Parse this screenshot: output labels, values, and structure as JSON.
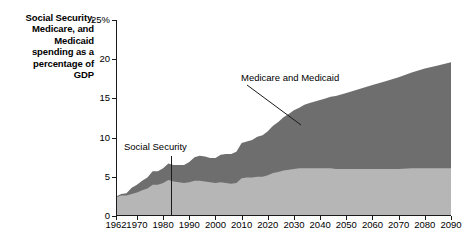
{
  "title": {
    "lines": [
      "Social Security,",
      "Medicare, and",
      "Medicaid",
      "spending as a",
      "percentage of",
      "GDP"
    ]
  },
  "annotations": {
    "social_security": "Social Security",
    "medicare_medicaid": "Medicare and Medicaid"
  },
  "colors": {
    "social_security_band": "#b6b6b6",
    "medicare_medicaid_band": "#6e6e6e",
    "axis": "#1a1a1a",
    "background": "#ffffff"
  },
  "chart_data": {
    "type": "area",
    "stacked": true,
    "title": "Social Security, Medicare, and Medicaid spending as a percentage of GDP",
    "xlabel": "",
    "ylabel": "",
    "xlim": [
      1962,
      2090
    ],
    "ylim": [
      0,
      25
    ],
    "grid": false,
    "legend": "annotations-inline",
    "ytick_labels": [
      "0",
      "5",
      "10",
      "15",
      "20",
      "25%"
    ],
    "ytick_values": [
      0,
      5,
      10,
      15,
      20,
      25
    ],
    "xtick_labels": [
      "1962",
      "1970",
      "1980",
      "1990",
      "2000",
      "2010",
      "2020",
      "2030",
      "2040",
      "2050",
      "2060",
      "2070",
      "2080",
      "2090"
    ],
    "xtick_values": [
      1962,
      1970,
      1980,
      1990,
      2000,
      2010,
      2020,
      2030,
      2040,
      2050,
      2060,
      2070,
      2080,
      2090
    ],
    "x": [
      1962,
      1964,
      1966,
      1968,
      1970,
      1972,
      1974,
      1976,
      1978,
      1980,
      1982,
      1984,
      1986,
      1988,
      1990,
      1992,
      1994,
      1996,
      1998,
      2000,
      2002,
      2004,
      2006,
      2008,
      2010,
      2012,
      2014,
      2016,
      2018,
      2020,
      2022,
      2024,
      2026,
      2028,
      2030,
      2032,
      2034,
      2036,
      2038,
      2040,
      2042,
      2044,
      2046,
      2048,
      2050,
      2055,
      2060,
      2065,
      2070,
      2075,
      2080,
      2085,
      2090
    ],
    "series": [
      {
        "name": "Social Security",
        "color": "#b6b6b6",
        "values": [
          2.4,
          2.6,
          2.6,
          2.8,
          3.0,
          3.3,
          3.5,
          4.0,
          4.0,
          4.2,
          4.6,
          4.4,
          4.3,
          4.2,
          4.3,
          4.5,
          4.5,
          4.4,
          4.3,
          4.2,
          4.3,
          4.2,
          4.1,
          4.2,
          4.8,
          4.9,
          4.9,
          5.0,
          5.0,
          5.2,
          5.5,
          5.6,
          5.8,
          5.9,
          6.0,
          6.1,
          6.1,
          6.1,
          6.1,
          6.1,
          6.1,
          6.1,
          6.0,
          6.0,
          6.0,
          6.0,
          6.0,
          6.0,
          6.0,
          6.1,
          6.1,
          6.1,
          6.1
        ]
      },
      {
        "name": "Medicare and Medicaid",
        "color": "#6e6e6e",
        "values": [
          0.1,
          0.2,
          0.3,
          0.8,
          1.0,
          1.2,
          1.4,
          1.7,
          1.7,
          1.9,
          2.1,
          2.1,
          2.2,
          2.3,
          2.6,
          3.0,
          3.2,
          3.2,
          3.1,
          3.2,
          3.5,
          3.7,
          3.8,
          4.0,
          4.5,
          4.6,
          4.8,
          5.1,
          5.3,
          5.6,
          6.0,
          6.4,
          6.8,
          7.1,
          7.5,
          7.7,
          8.1,
          8.3,
          8.5,
          8.7,
          8.9,
          9.1,
          9.3,
          9.5,
          9.7,
          10.2,
          10.7,
          11.2,
          11.7,
          12.2,
          12.7,
          13.1,
          13.5
        ]
      }
    ],
    "total_values": [
      2.5,
      2.8,
      2.9,
      3.6,
      4.0,
      4.5,
      4.9,
      5.7,
      5.7,
      6.1,
      6.7,
      6.5,
      6.5,
      6.5,
      6.9,
      7.5,
      7.7,
      7.6,
      7.4,
      7.4,
      7.8,
      7.9,
      7.9,
      8.2,
      9.3,
      9.5,
      9.7,
      10.1,
      10.3,
      10.8,
      11.5,
      12.0,
      12.6,
      13.0,
      13.5,
      13.8,
      14.2,
      14.4,
      14.6,
      14.8,
      15.0,
      15.2,
      15.3,
      15.5,
      15.7,
      16.2,
      16.7,
      17.2,
      17.7,
      18.3,
      18.8,
      19.2,
      19.6
    ]
  }
}
